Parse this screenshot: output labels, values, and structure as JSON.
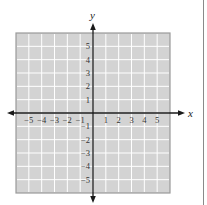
{
  "figure": {
    "type": "coordinate-plane",
    "axes": {
      "x_label": "x",
      "y_label": "y",
      "x_ticks": [
        -5,
        -4,
        -3,
        -2,
        -1,
        1,
        2,
        3,
        4,
        5
      ],
      "y_ticks": [
        5,
        4,
        3,
        2,
        1,
        -1,
        -2,
        -3,
        -4,
        -5
      ],
      "x_tick_labels": [
        "−5",
        "−4",
        "−3",
        "−2",
        "−1",
        "1",
        "2",
        "3",
        "4",
        "5"
      ],
      "y_tick_labels": [
        "5",
        "4",
        "3",
        "2",
        "1",
        "−1",
        "−2",
        "−3",
        "−4",
        "−5"
      ],
      "x_range": [
        -6,
        6
      ],
      "y_range": [
        -6,
        6
      ],
      "arrows": [
        "left-arrow",
        "right-arrow",
        "up-arrow",
        "down-arrow"
      ]
    },
    "grid": {
      "columns": 12,
      "rows": 12,
      "background_color": "#d3d3d3",
      "line_color": "#ffffff",
      "border_color": "#9a9a9a"
    },
    "axis_color": "#1a1a1a"
  }
}
